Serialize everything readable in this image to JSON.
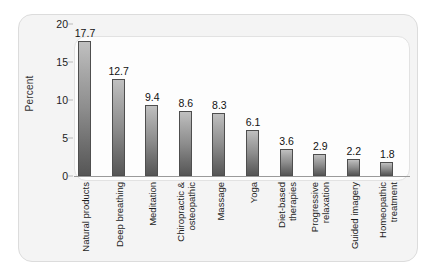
{
  "chart_data": {
    "type": "bar",
    "title": "",
    "xlabel": "",
    "ylabel": "Percent",
    "ylim": [
      0,
      20
    ],
    "yticks": [
      0,
      5,
      10,
      15,
      20
    ],
    "ytick_labels": [
      "0",
      "5",
      "10",
      "15",
      "20"
    ],
    "grid": false,
    "legend": "none",
    "orientation": "vertical",
    "value_labels_shown": true,
    "category_label_rotation": "90deg-vertical",
    "categories": [
      "Natural products",
      "Deep breathing",
      "Meditation",
      "Chiropractic & osteopathic",
      "Massage",
      "Yoga",
      "Diet-based therapies",
      "Progressive relaxation",
      "Guided imagery",
      "Homeopathic treatment"
    ],
    "category_lines": [
      [
        "Natural products"
      ],
      [
        "Deep breathing"
      ],
      [
        "Meditation"
      ],
      [
        "Chiropractic &",
        "osteopathic"
      ],
      [
        "Massage"
      ],
      [
        "Yoga"
      ],
      [
        "Diet-based",
        "therapies"
      ],
      [
        "Progressive",
        "relaxation"
      ],
      [
        "Guided imagery"
      ],
      [
        "Homeopathic",
        "treatment"
      ]
    ],
    "values": [
      17.7,
      12.7,
      9.4,
      8.6,
      8.3,
      6.1,
      3.6,
      2.9,
      2.2,
      1.8
    ],
    "value_labels": [
      "17.7",
      "12.7",
      "9.4",
      "8.6",
      "8.3",
      "6.1",
      "3.6",
      "2.9",
      "2.2",
      "1.8"
    ]
  },
  "style": {
    "bar_top_color": "#c0c0c0",
    "bar_bottom_color": "#565656",
    "bar_border_color": "#4e4e4e",
    "panel_background": "#f4f4f4",
    "plot_background": "#fdfdfd",
    "axis_color": "#9a9a9a",
    "text_color": "#1c1c1c"
  }
}
